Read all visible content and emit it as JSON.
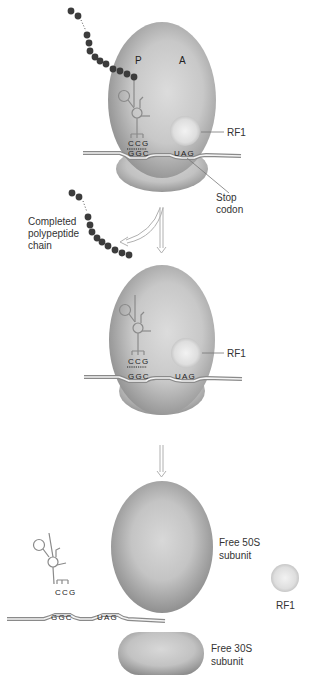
{
  "figure": {
    "colors": {
      "ribosome_light": "#d6d6d6",
      "ribosome_dark": "#8e8e8e",
      "rf1_light": "#eeeeee",
      "rf1_dark": "#c4c4c4",
      "polypeptide_bead": "#3c3c3c",
      "mrna_stroke": "#8a8a8a",
      "label_text": "#333333",
      "arrow_stroke": "#b0b0b0"
    },
    "panels": [
      {
        "id": "panel-1",
        "site_labels": {
          "p": "P",
          "a": "A"
        },
        "anticodon": "CCG",
        "codon_p": "GGC",
        "stop_codon_seq": "UAG",
        "rf1_label": "RF1",
        "stop_label_line1": "Stop",
        "stop_label_line2": "codon"
      },
      {
        "id": "panel-2",
        "released_label_line1": "Completed",
        "released_label_line2": "polypeptide",
        "released_label_line3": "chain",
        "anticodon": "CCG",
        "codon_p": "GGC",
        "stop_codon_seq": "UAG",
        "rf1_label": "RF1"
      },
      {
        "id": "panel-3",
        "large_subunit_line1": "Free 50S",
        "large_subunit_line2": "subunit",
        "small_subunit_line1": "Free 30S",
        "small_subunit_line2": "subunit",
        "anticodon": "CCG",
        "codon_p": "GGC",
        "stop_codon_seq": "UAG",
        "rf1_label": "RF1"
      }
    ]
  }
}
